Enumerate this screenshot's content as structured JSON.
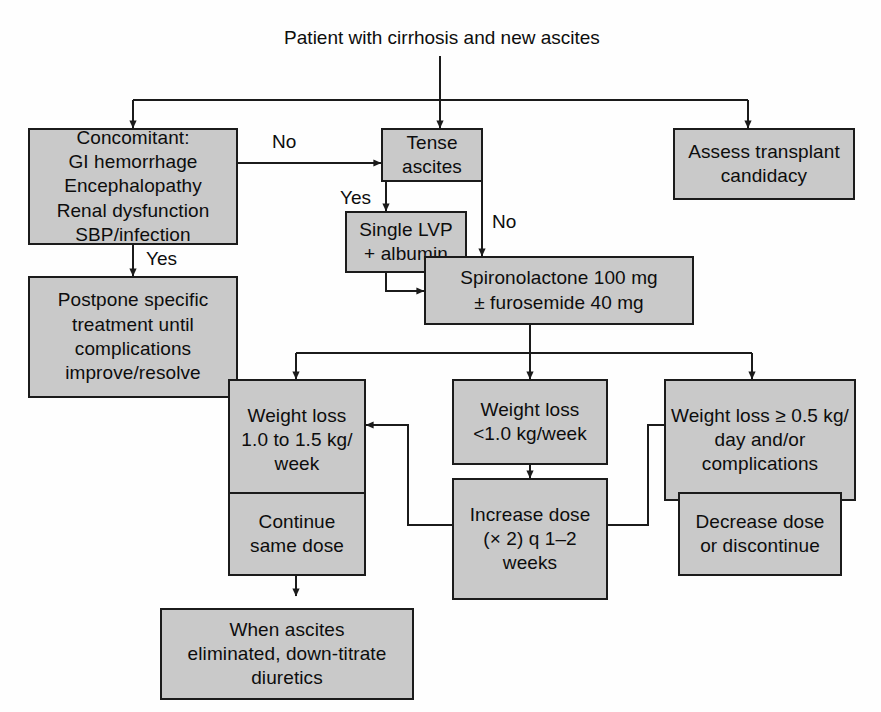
{
  "diagram": {
    "title": "Patient with cirrhosis and new ascites",
    "colors": {
      "box_fill": "#c9c9c9",
      "box_border": "#1b1b1b",
      "line": "#1b1b1b",
      "text": "#0d0d0d",
      "background": "#fefefe"
    },
    "nodes": [
      {
        "id": "start",
        "label": "Patient with cirrhosis and new ascites"
      },
      {
        "id": "concomitant",
        "label": "Concomitant:\nGI hemorrhage\nEncephalopathy\nRenal dysfunction\nSBP/infection"
      },
      {
        "id": "tense_ascites",
        "label": "Tense ascites"
      },
      {
        "id": "assess",
        "label": "Assess transplant\ncandidacy"
      },
      {
        "id": "postpone",
        "label": "Postpone specific\ntreatment until\ncomplications\nimprove/resolve"
      },
      {
        "id": "lvp",
        "label": "Single LVP\n+ albumin"
      },
      {
        "id": "spironolactone",
        "label": "Spironolactone 100 mg\n± furosemide 40 mg"
      },
      {
        "id": "wl_mid",
        "label": "Weight loss\n1.0 to 1.5 kg/\nweek"
      },
      {
        "id": "wl_low",
        "label": "Weight loss\n<1.0 kg/week"
      },
      {
        "id": "wl_high",
        "label": "Weight loss ≥ 0.5 kg/\nday and/or\ncomplications"
      },
      {
        "id": "continue",
        "label": "Continue\nsame dose"
      },
      {
        "id": "increase",
        "label": "Increase dose\n(× 2) q 1–2\nweeks"
      },
      {
        "id": "decrease",
        "label": "Decrease dose\nor discontinue"
      },
      {
        "id": "downtitrate",
        "label": "When ascites\neliminated, down-titrate\ndiuretics"
      }
    ],
    "edge_labels": [
      {
        "id": "no_concomitant",
        "text": "No"
      },
      {
        "id": "yes_concomitant",
        "text": "Yes"
      },
      {
        "id": "yes_tense",
        "text": "Yes"
      },
      {
        "id": "no_tense",
        "text": "No"
      }
    ]
  }
}
